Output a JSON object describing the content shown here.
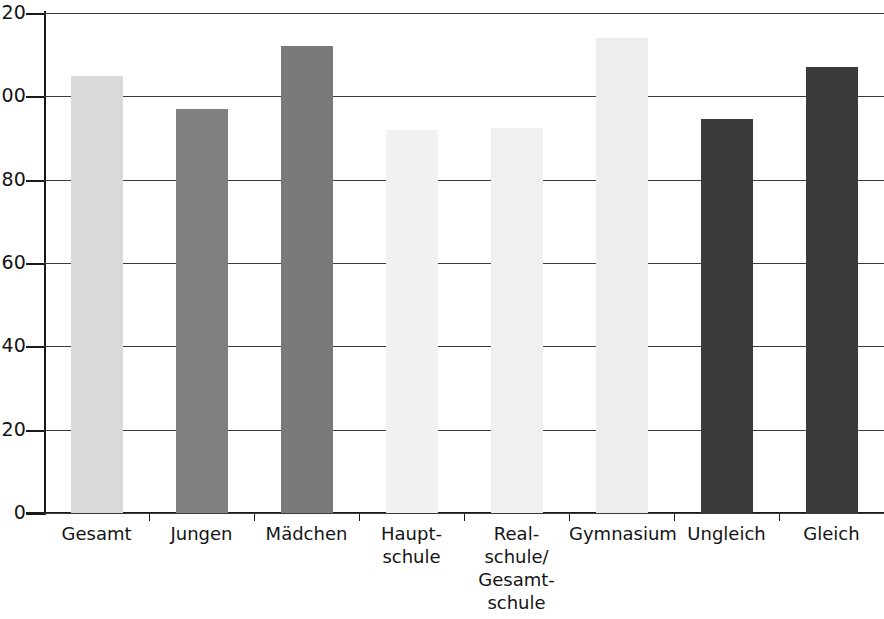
{
  "chart_data": {
    "type": "bar",
    "title": "",
    "subtitle": "",
    "xlabel": "",
    "ylabel": "",
    "ylim": [
      0,
      120
    ],
    "ytick_labels": [
      "0",
      "20",
      "40",
      "60",
      "80",
      "100",
      "120"
    ],
    "ytick_values": [
      0,
      20,
      40,
      60,
      80,
      100,
      120
    ],
    "grid": true,
    "legend": "none",
    "categories": [
      "Gesamt",
      "Jungen",
      "Mädchen",
      "Haupt-\nschule",
      "Real-\nschule/\nGesamt-\nschule",
      "Gymnasium",
      "Ungleich",
      "Gleich"
    ],
    "values": [
      105,
      97,
      112,
      92,
      92.5,
      114,
      94.5,
      107
    ],
    "bar_colors": [
      "#d9d9d9",
      "#808080",
      "#7a7a7a",
      "#f1f1f1",
      "#f0f0f0",
      "#ededed",
      "#3a3a3a",
      "#3a3a3a"
    ],
    "axis_color": "#1a1a1a",
    "gridline_color": "#3b3b3b"
  }
}
